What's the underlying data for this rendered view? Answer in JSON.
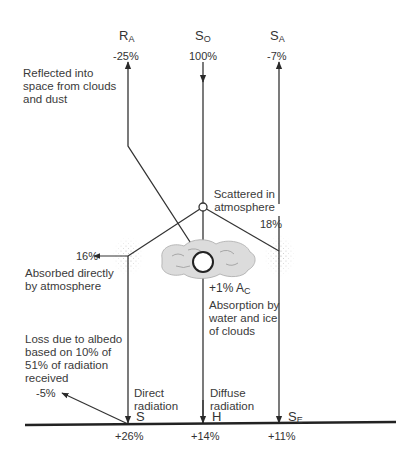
{
  "diagram": {
    "top_flows": [
      {
        "symbol": "R",
        "subscript": "A",
        "value": "-25%",
        "direction": "up"
      },
      {
        "symbol": "S",
        "subscript": "O",
        "value": "100%",
        "direction": "down"
      },
      {
        "symbol": "S",
        "subscript": "A",
        "value": "-7%",
        "direction": "up"
      }
    ],
    "labels": {
      "reflected": "Reflected into space from clouds and dust",
      "reflected_lines": [
        "Reflected into",
        "space from clouds",
        "and dust"
      ],
      "scattered_lines": [
        "Scattered in",
        "atmosphere"
      ],
      "absorbed_lines": [
        "Absorbed directly",
        "by atmosphere"
      ],
      "absorbed_value": "16%",
      "scatter_right_value": "18%",
      "cloud_value": "+1%",
      "cloud_symbol": "A",
      "cloud_subscript": "C",
      "cloud_absorption_lines": [
        "Absorption by",
        "water and ice",
        "of clouds"
      ],
      "albedo_lines": [
        "Loss due to albedo",
        "based on 10% of",
        "51% of radiation",
        "received"
      ],
      "albedo_value": "-5%",
      "direct_lines": [
        "Direct",
        "radiation"
      ],
      "diffuse_lines": [
        "Diffuse",
        "radiation"
      ]
    },
    "ground_flows": [
      {
        "symbol": "S",
        "subscript": "",
        "value": "+26%"
      },
      {
        "symbol": "H",
        "subscript": "",
        "value": "+14%"
      },
      {
        "symbol": "S",
        "subscript": "E",
        "value": "+11%"
      }
    ],
    "colors": {
      "line": "#333333",
      "cloud": "#d8d8d8",
      "stipple": "#9a9a9a"
    }
  }
}
